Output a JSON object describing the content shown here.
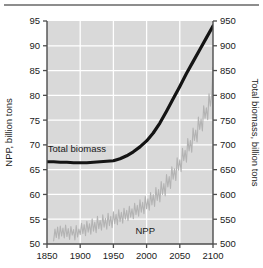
{
  "figure": {
    "top_rule": "horizontal-rule",
    "background_color": "#ffffff",
    "plot_background_color": "#d9d9d9",
    "gridline_color": "#ffffff",
    "axis_color": "#4d4d4d"
  },
  "chart_data": {
    "type": "line",
    "title": "",
    "xlabel": "",
    "ylabel": "NPP, billion tons",
    "y2label": "Total biomass, billion tons",
    "xlim": [
      1850,
      2100
    ],
    "ylim": [
      50,
      95
    ],
    "y2lim": [
      500,
      950
    ],
    "xticks": [
      1850,
      1900,
      1950,
      2000,
      2050,
      2100
    ],
    "yticks": [
      50,
      55,
      60,
      65,
      70,
      75,
      80,
      85,
      90,
      95
    ],
    "y2ticks": [
      500,
      550,
      600,
      650,
      700,
      750,
      800,
      850,
      900,
      950
    ],
    "grid": true,
    "legend_position": "inline-annotations",
    "annotations": [
      {
        "text": "Total biomass",
        "x": 1895,
        "y": 68.6,
        "color": "#1a1a1a"
      },
      {
        "text": "NPP",
        "x": 1998,
        "y": 52.0,
        "color": "#1a1a1a"
      }
    ],
    "series": [
      {
        "name": "Total biomass",
        "axis": "right",
        "color": "#141414",
        "linewidth": 3.2,
        "units": "billion tons",
        "x": [
          1850,
          1860,
          1870,
          1880,
          1890,
          1900,
          1910,
          1920,
          1930,
          1940,
          1950,
          1960,
          1970,
          1980,
          1990,
          2000,
          2010,
          2020,
          2030,
          2040,
          2050,
          2060,
          2070,
          2080,
          2090,
          2100
        ],
        "values": [
          666,
          666,
          665,
          665,
          664,
          664,
          664,
          665,
          666,
          667,
          668,
          672,
          678,
          686,
          696,
          708,
          724,
          744,
          768,
          793,
          818,
          844,
          868,
          892,
          916,
          940
        ]
      },
      {
        "name": "NPP",
        "axis": "left",
        "color": "#b3b3b3",
        "linewidth": 1.1,
        "units": "billion tons",
        "description": "noisy annual series rising from ~52 in 1860 to ~85 by 2100",
        "x": [
          1860,
          1862,
          1864,
          1866,
          1868,
          1870,
          1872,
          1874,
          1876,
          1878,
          1880,
          1882,
          1884,
          1886,
          1888,
          1890,
          1892,
          1894,
          1896,
          1898,
          1900,
          1902,
          1904,
          1906,
          1908,
          1910,
          1912,
          1914,
          1916,
          1918,
          1920,
          1922,
          1924,
          1926,
          1928,
          1930,
          1932,
          1934,
          1936,
          1938,
          1940,
          1942,
          1944,
          1946,
          1948,
          1950,
          1952,
          1954,
          1956,
          1958,
          1960,
          1962,
          1964,
          1966,
          1968,
          1970,
          1972,
          1974,
          1976,
          1978,
          1980,
          1982,
          1984,
          1986,
          1988,
          1990,
          1992,
          1994,
          1996,
          1998,
          2000,
          2002,
          2004,
          2006,
          2008,
          2010,
          2012,
          2014,
          2016,
          2018,
          2020,
          2022,
          2024,
          2026,
          2028,
          2030,
          2032,
          2034,
          2036,
          2038,
          2040,
          2042,
          2044,
          2046,
          2048,
          2050,
          2052,
          2054,
          2056,
          2058,
          2060,
          2062,
          2064,
          2066,
          2068,
          2070,
          2072,
          2074,
          2076,
          2078,
          2080,
          2082,
          2084,
          2086,
          2088,
          2090,
          2092,
          2094,
          2096,
          2098,
          2100
        ],
        "values": [
          50.6,
          53.0,
          51.3,
          53.4,
          51.0,
          53.6,
          51.6,
          53.2,
          51.2,
          53.8,
          51.5,
          53.1,
          50.9,
          53.5,
          51.8,
          52.9,
          50.8,
          53.7,
          51.4,
          53.0,
          51.9,
          54.2,
          52.1,
          53.9,
          51.7,
          54.6,
          52.4,
          54.1,
          52.0,
          55.1,
          52.6,
          54.4,
          52.3,
          55.6,
          53.1,
          54.8,
          52.8,
          55.9,
          53.4,
          55.2,
          53.0,
          56.2,
          53.7,
          55.6,
          53.3,
          56.5,
          54.1,
          56.0,
          53.9,
          56.9,
          54.5,
          56.4,
          54.2,
          57.2,
          55.0,
          56.8,
          54.7,
          57.6,
          55.4,
          57.1,
          55.1,
          58.2,
          55.9,
          57.8,
          55.6,
          58.9,
          56.4,
          58.4,
          56.1,
          59.6,
          57.1,
          59.1,
          56.8,
          60.4,
          57.9,
          60.0,
          57.6,
          61.4,
          58.8,
          61.0,
          58.5,
          62.6,
          60.0,
          62.2,
          59.7,
          64.0,
          61.5,
          63.6,
          61.2,
          65.6,
          63.1,
          65.2,
          62.8,
          67.4,
          64.9,
          67.0,
          64.6,
          69.3,
          66.8,
          68.9,
          66.5,
          71.3,
          68.8,
          70.9,
          68.5,
          73.4,
          70.9,
          73.0,
          70.6,
          75.6,
          73.1,
          75.2,
          72.8,
          77.9,
          75.4,
          77.5,
          75.1,
          80.3,
          77.8,
          79.9,
          85.6
        ]
      }
    ]
  }
}
